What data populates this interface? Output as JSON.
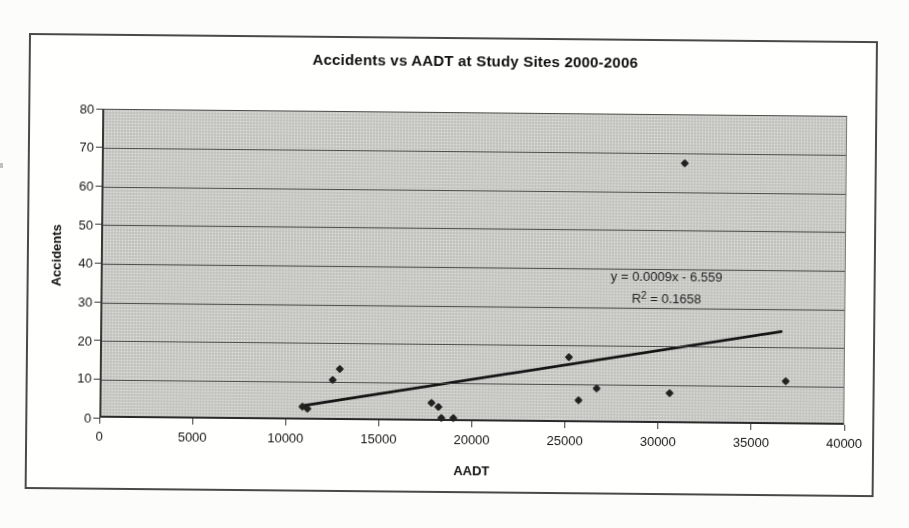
{
  "chart_data": {
    "type": "scatter",
    "title": "Accidents vs AADT at Study Sites 2000-2006",
    "xlabel": "AADT",
    "ylabel": "Accidents",
    "xlim": [
      0,
      40000
    ],
    "ylim": [
      0,
      80
    ],
    "x_ticks": [
      0,
      5000,
      10000,
      15000,
      20000,
      25000,
      30000,
      35000,
      40000
    ],
    "y_ticks": [
      0,
      10,
      20,
      30,
      40,
      50,
      60,
      70,
      80
    ],
    "grid": "horizontal-only",
    "legend": "none",
    "series": [
      {
        "name": "Accidents",
        "marker": "diamond",
        "points": [
          [
            10800,
            3.5
          ],
          [
            11050,
            3
          ],
          [
            12400,
            10.5
          ],
          [
            12800,
            13.5
          ],
          [
            17700,
            5
          ],
          [
            18100,
            4
          ],
          [
            18250,
            1
          ],
          [
            18900,
            1
          ],
          [
            25100,
            17
          ],
          [
            25600,
            6
          ],
          [
            26600,
            9
          ],
          [
            30500,
            8
          ],
          [
            31200,
            67.5
          ],
          [
            36700,
            11.5
          ]
        ]
      }
    ],
    "trendline": {
      "type": "linear",
      "slope": 0.0009,
      "intercept": -6.559,
      "r_squared": 0.1658,
      "x_start": 10860,
      "y_start": 3.2,
      "x_end": 36700,
      "y_end": 23.7
    },
    "annotation": {
      "line1": "y = 0.0009x - 6.559",
      "line2_prefix": "R",
      "line2_sup": "2",
      "line2_rest": " = 0.1658"
    }
  },
  "colors": {
    "page_bg": "#fcfcfa",
    "plot_bg": "#c9c9c6",
    "gridline": "#454545",
    "marker": "#232323",
    "trendline": "#161616",
    "frame_border": "#4a4a4a",
    "text": "#1e1e1e"
  }
}
